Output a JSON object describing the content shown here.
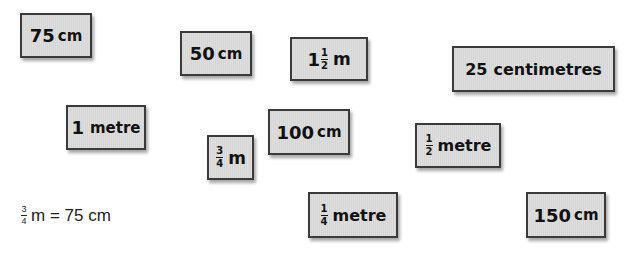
{
  "cards": {
    "c75cm": {
      "num": "75",
      "unit": "cm"
    },
    "c50cm": {
      "num": "50",
      "unit": "cm"
    },
    "c1half_m": {
      "whole": "1",
      "frac_num": "1",
      "frac_den": "2",
      "unit": "m"
    },
    "c25centimetres": {
      "num": "25",
      "unit": "centimetres"
    },
    "c1metre": {
      "num": "1",
      "unit": "metre"
    },
    "c3quarter_m": {
      "frac_num": "3",
      "frac_den": "4",
      "unit": "m"
    },
    "c100cm": {
      "num": "100",
      "unit": "cm"
    },
    "chalf_metre": {
      "frac_num": "1",
      "frac_den": "2",
      "unit": "metre"
    },
    "cquarter_metre": {
      "frac_num": "1",
      "frac_den": "4",
      "unit": "metre"
    },
    "c150cm": {
      "num": "150",
      "unit": "cm"
    }
  },
  "example": {
    "frac_num": "3",
    "frac_den": "4",
    "text": "m = 75 cm"
  },
  "colors": {
    "card_bg": "#dcdcdc",
    "card_border": "#3a3a3a"
  }
}
